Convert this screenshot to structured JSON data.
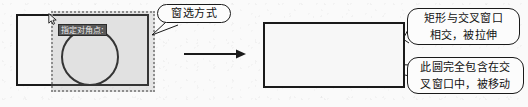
{
  "figure": {
    "background_color": "#fafafa",
    "ink_color": "#1a1a1a"
  },
  "left_panel": {
    "name": "window-selection-step",
    "shapes": {
      "rectangle_label": "矩形",
      "circle_label": "圆"
    },
    "selection_window": {
      "type": "crossing-window",
      "fill_color": "#9a9a9a",
      "border_style": "dotted",
      "border_color": "#8d8d8d"
    },
    "prompt_tooltip": {
      "text": "指定对角点:",
      "background_color": "#585858",
      "text_color": "#e8e8e8"
    },
    "cursor": {
      "icon": "arrow-cursor-icon"
    }
  },
  "transition": {
    "icon": "right-arrow-icon",
    "label": "→"
  },
  "right_panel": {
    "name": "result-step",
    "shapes": {
      "rectangle_label": "矩形",
      "circle_label": "圆"
    }
  },
  "callouts": [
    {
      "id": "window-mode",
      "lines": [
        "窗选方式"
      ],
      "points_to": "crossing-window"
    },
    {
      "id": "rect-stretch",
      "lines": [
        "矩形与交叉窗口",
        "相交，被拉伸"
      ],
      "points_to": "right-rectangle-edge"
    },
    {
      "id": "circle-move",
      "lines": [
        "此圆完全包含在交",
        "叉窗口中，被移动"
      ],
      "points_to": "right-circle"
    }
  ]
}
